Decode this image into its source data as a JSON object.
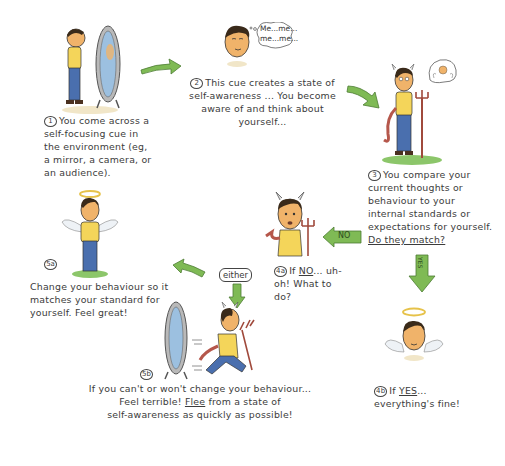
{
  "diagram": {
    "colors": {
      "arrow_green": "#7fba55",
      "arrow_outline": "#4d7c34",
      "skin": "#f0b36a",
      "shirt": "#f4d55a",
      "jeans": "#4a6fae",
      "devil": "#b5574b",
      "halo": "#e6c24a",
      "mirror_glass": "#9cc0e0",
      "grass": "#8cc66a"
    },
    "steps": [
      {
        "id": "1",
        "label": "1",
        "text": "You come across a self-focusing cue in the environment (eg, a mirror, a camera, or an audience)."
      },
      {
        "id": "2",
        "label": "2",
        "text": "This cue creates a state of self-awareness ... You become aware of and think about yourself..."
      },
      {
        "id": "3",
        "label": "3",
        "text": "You compare your current thoughts or behaviour to your internal standards or expectations for yourself.",
        "question": "Do they match?"
      },
      {
        "id": "4a",
        "label": "4a",
        "prefix": "If",
        "keyword": "NO",
        "text": "... uh-oh! What to do?"
      },
      {
        "id": "4b",
        "label": "4b",
        "prefix": "If",
        "keyword": "YES",
        "text": "... everything's fine!"
      },
      {
        "id": "5a",
        "label": "5a",
        "text": "Change your behaviour so it matches your standard for yourself. Feel great!"
      },
      {
        "id": "5b",
        "label": "5b",
        "line1": "If you can't or won't change your behaviour...",
        "line2_pre": "Feel terrible!",
        "line2_kw": "Flee",
        "line2_post": "from a state of",
        "line3": "self-awareness as quickly as possible!"
      }
    ],
    "speech_bubble": "Me...me... me...me...",
    "arrow_labels": {
      "no": "NO",
      "yes": "YES",
      "either": "either"
    }
  }
}
